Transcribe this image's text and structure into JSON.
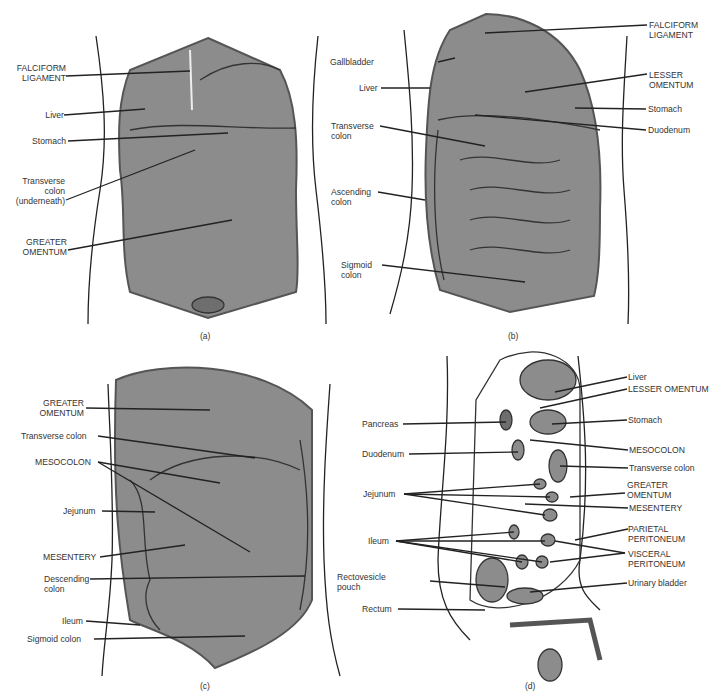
{
  "colors": {
    "organ_fill": "#8c8c8c",
    "organ_dark": "#6e6e6e",
    "line": "#222222",
    "background": "#ffffff"
  },
  "panels": {
    "a": {
      "caption": "(a)",
      "labels": {
        "falciform_ligament": "FALCIFORM\nLIGAMENT",
        "liver": "Liver",
        "stomach": "Stomach",
        "transverse_colon": "Transverse\ncolon\n(underneath)",
        "greater_omentum": "GREATER\nOMENTUM"
      }
    },
    "b": {
      "caption": "(b)",
      "labels": {
        "gallbladder": "Gallbladder",
        "liver": "Liver",
        "transverse_colon": "Transverse\ncolon",
        "ascending_colon": "Ascending\ncolon",
        "sigmoid_colon": "Sigmoid\ncolon",
        "falciform_ligament": "FALCIFORM\nLIGAMENT",
        "lesser_omentum": "LESSER\nOMENTUM",
        "stomach": "Stomach",
        "duodenum": "Duodenum"
      }
    },
    "c": {
      "caption": "(c)",
      "labels": {
        "greater_omentum": "GREATER\nOMENTUM",
        "transverse_colon": "Transverse colon",
        "mesocolon": "MESOCOLON",
        "jejunum": "Jejunum",
        "mesentery": "MESENTERY",
        "descending_colon": "Descending\ncolon",
        "ileum": "Ileum",
        "sigmoid_colon": "Sigmoid colon"
      }
    },
    "d": {
      "caption": "(d)",
      "labels": {
        "pancreas": "Pancreas",
        "duodenum": "Duodenum",
        "jejunum": "Jejunum",
        "ileum": "Ileum",
        "rectovesicle_pouch": "Rectovesicle\npouch",
        "rectum": "Rectum",
        "liver": "Liver",
        "lesser_omentum": "LESSER OMENTUM",
        "stomach": "Stomach",
        "mesocolon": "MESOCOLON",
        "transverse_colon": "Transverse colon",
        "greater_omentum": "GREATER\nOMENTUM",
        "mesentery": "MESENTERY",
        "parietal_peritoneum": "PARIETAL\nPERITONEUM",
        "visceral_peritoneum": "VISCERAL\nPERITONEUM",
        "urinary_bladder": "Urinary bladder"
      }
    }
  }
}
